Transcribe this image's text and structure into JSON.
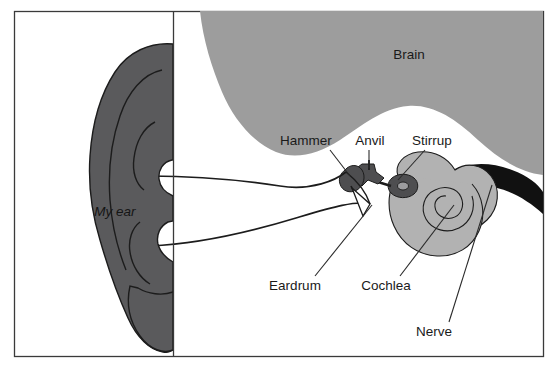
{
  "figure": {
    "width": 557,
    "height": 378,
    "background": "#ffffff",
    "border_color": "#3a3a3a",
    "divider_x": 173
  },
  "palette": {
    "pinna_gray": "#5a5a5c",
    "brain_gray": "#9d9d9d",
    "cochlea_gray": "#b2b2b2",
    "ossicle_gray": "#4e4e50",
    "nerve_black": "#111111",
    "canal_white": "#ffffff",
    "outline": "#1c1c1c",
    "text": "#1a1a1a"
  },
  "labels": [
    {
      "id": "brain",
      "text": "Brain",
      "x": 409,
      "y": 55,
      "anchor": "middle",
      "style": "plain",
      "leader": false
    },
    {
      "id": "hammer",
      "text": "Hammer",
      "x": 306,
      "y": 141,
      "anchor": "middle",
      "style": "plain",
      "leader": true
    },
    {
      "id": "anvil",
      "text": "Anvil",
      "x": 370,
      "y": 141,
      "anchor": "middle",
      "style": "plain",
      "leader": true
    },
    {
      "id": "stirrup",
      "text": "Stirrup",
      "x": 432,
      "y": 141,
      "anchor": "middle",
      "style": "plain",
      "leader": true
    },
    {
      "id": "my-ear",
      "text": "My ear",
      "x": 115,
      "y": 212,
      "anchor": "middle",
      "style": "italic",
      "leader": false
    },
    {
      "id": "eardrum",
      "text": "Eardrum",
      "x": 295,
      "y": 286,
      "anchor": "middle",
      "style": "plain",
      "leader": true
    },
    {
      "id": "cochlea",
      "text": "Cochlea",
      "x": 386,
      "y": 286,
      "anchor": "middle",
      "style": "plain",
      "leader": true
    },
    {
      "id": "nerve",
      "text": "Nerve",
      "x": 434,
      "y": 332,
      "anchor": "middle",
      "style": "plain",
      "leader": true
    }
  ],
  "leader_lines": [
    {
      "id": "hammer-leader",
      "from": [
        330,
        150
      ],
      "to": [
        350,
        176
      ]
    },
    {
      "id": "anvil-leader",
      "from": [
        369,
        150
      ],
      "to": [
        369,
        168
      ]
    },
    {
      "id": "stirrup-leader",
      "from": [
        425,
        150
      ],
      "to": [
        398,
        180
      ]
    },
    {
      "id": "eardrum-leader",
      "from": [
        315,
        276
      ],
      "to": [
        372,
        205
      ]
    },
    {
      "id": "cochlea-leader",
      "from": [
        400,
        276
      ],
      "to": [
        454,
        205
      ]
    },
    {
      "id": "nerve-leader",
      "from": [
        449,
        322
      ],
      "to": [
        492,
        185
      ]
    }
  ],
  "parts": [
    {
      "id": "pinna",
      "name": "Outer ear (pinna)",
      "fill": "#5a5a5c"
    },
    {
      "id": "canal",
      "name": "Ear canal",
      "fill": "#ffffff"
    },
    {
      "id": "eardrum",
      "name": "Eardrum",
      "fill": "#ffffff"
    },
    {
      "id": "hammer",
      "name": "Hammer (malleus)",
      "fill": "#4e4e50"
    },
    {
      "id": "anvil",
      "name": "Anvil (incus)",
      "fill": "#4e4e50"
    },
    {
      "id": "stirrup",
      "name": "Stirrup (stapes)",
      "fill": "#4e4e50"
    },
    {
      "id": "cochlea",
      "name": "Cochlea",
      "fill": "#b2b2b2"
    },
    {
      "id": "nerve",
      "name": "Auditory nerve",
      "fill": "#111111"
    },
    {
      "id": "brain",
      "name": "Brain",
      "fill": "#9d9d9d"
    }
  ]
}
